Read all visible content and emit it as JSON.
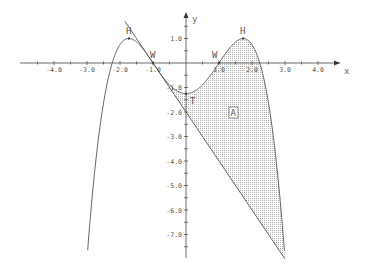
{
  "chart_data": {
    "type": "line",
    "title": "",
    "xlabel": "x",
    "ylabel": "y",
    "xlim": [
      -4.5,
      4.8
    ],
    "ylim": [
      -8.0,
      1.7
    ],
    "grid": false,
    "x_ticks": [
      "-4.0",
      "-3.0",
      "-2.0",
      "-1.0",
      "1.0",
      "2.0",
      "3.0",
      "4.0"
    ],
    "y_ticks": [
      "1.0",
      "-1.0",
      "-2.0",
      "-3.0",
      "-4.0",
      "-5.0",
      "-6.0",
      "-7.0"
    ],
    "series": [
      {
        "name": "f(x) = -0.25x^4 + 1.5x^2 - 1.25",
        "kind": "curve",
        "x": [
          -3.19,
          -3.0,
          -2.5,
          -2.0,
          -1.73,
          -1.5,
          -1.0,
          -0.5,
          0.0,
          0.5,
          1.0,
          1.5,
          1.73,
          2.0,
          2.5,
          3.0
        ],
        "values": [
          -8.0,
          -8.0,
          -1.64,
          0.75,
          1.0,
          0.86,
          0.0,
          -0.89,
          -1.25,
          -0.89,
          0.0,
          0.86,
          1.0,
          0.75,
          -1.64,
          -8.0
        ]
      },
      {
        "name": "tangent at W(-1, 0): y = -2x - 2",
        "kind": "line",
        "x": [
          -2.0,
          3.0
        ],
        "values": [
          2.0,
          -8.0
        ]
      }
    ],
    "shaded_region": {
      "label": "A",
      "between": [
        "f(x)",
        "tangent"
      ],
      "x_range": [
        -1.0,
        3.0
      ]
    },
    "points": [
      {
        "label": "H",
        "x": -1.73,
        "y": 1.0
      },
      {
        "label": "W",
        "x": -1.0,
        "y": 0.0
      },
      {
        "label": "T",
        "x": 0.0,
        "y": -1.25
      },
      {
        "label": "W",
        "x": 1.0,
        "y": 0.0
      },
      {
        "label": "H",
        "x": 1.73,
        "y": 1.0
      }
    ],
    "annotations": [
      "A"
    ]
  }
}
